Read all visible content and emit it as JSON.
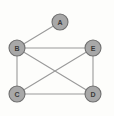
{
  "figure": {
    "width": 114,
    "height": 116,
    "background_color": "#fdfdfb"
  },
  "style": {
    "node_fill": "#a8a8a8",
    "node_stroke": "#6f6f6f",
    "node_radius": 8,
    "edge_color": "#9a9a9a",
    "edge_width": 1.1,
    "label_color": "#3a3a3a"
  },
  "chart_data": {
    "type": "diagram",
    "diagram_kind": "node-link-graph",
    "directed": false,
    "title": "",
    "nodes": [
      {
        "id": "A",
        "label": "A",
        "x": 60,
        "y": 22
      },
      {
        "id": "B",
        "label": "B",
        "x": 17,
        "y": 48
      },
      {
        "id": "E",
        "label": "E",
        "x": 93,
        "y": 48
      },
      {
        "id": "C",
        "label": "C",
        "x": 17,
        "y": 94
      },
      {
        "id": "D",
        "label": "D",
        "x": 93,
        "y": 94
      }
    ],
    "edges": [
      {
        "id": "A-B",
        "source": "A",
        "target": "B",
        "x1": 60,
        "y1": 22,
        "x2": 17,
        "y2": 48
      },
      {
        "id": "B-E",
        "source": "B",
        "target": "E",
        "x1": 17,
        "y1": 48,
        "x2": 93,
        "y2": 48
      },
      {
        "id": "B-C",
        "source": "B",
        "target": "C",
        "x1": 17,
        "y1": 48,
        "x2": 17,
        "y2": 94
      },
      {
        "id": "B-D",
        "source": "B",
        "target": "D",
        "x1": 17,
        "y1": 48,
        "x2": 93,
        "y2": 94
      },
      {
        "id": "C-E",
        "source": "C",
        "target": "E",
        "x1": 17,
        "y1": 94,
        "x2": 93,
        "y2": 48
      },
      {
        "id": "C-D",
        "source": "C",
        "target": "D",
        "x1": 17,
        "y1": 94,
        "x2": 93,
        "y2": 94
      },
      {
        "id": "E-D",
        "source": "E",
        "target": "D",
        "x1": 93,
        "y1": 48,
        "x2": 93,
        "y2": 94
      }
    ]
  }
}
